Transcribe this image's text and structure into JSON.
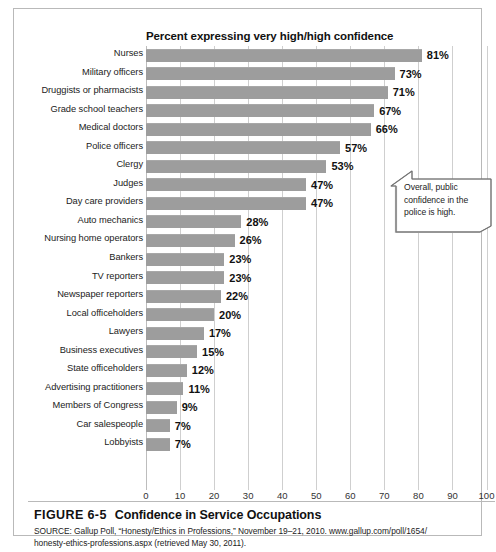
{
  "chart_data": {
    "type": "bar",
    "orientation": "horizontal",
    "title": "Percent expressing very high/high confidence",
    "xlabel": "",
    "ylabel": "",
    "xlim": [
      0,
      100
    ],
    "xticks": [
      0,
      10,
      20,
      30,
      40,
      50,
      60,
      70,
      80,
      90,
      100
    ],
    "grid": true,
    "legend": null,
    "bar_color": "#9d9d9d",
    "categories": [
      "Nurses",
      "Military officers",
      "Druggists or pharmacists",
      "Grade school teachers",
      "Medical doctors",
      "Police officers",
      "Clergy",
      "Judges",
      "Day care providers",
      "Auto mechanics",
      "Nursing home operators",
      "Bankers",
      "TV reporters",
      "Newspaper reporters",
      "Local officeholders",
      "Lawyers",
      "Business executives",
      "State officeholders",
      "Advertising practitioners",
      "Members of Congress",
      "Car salespeople",
      "Lobbyists"
    ],
    "values": [
      81,
      73,
      71,
      67,
      66,
      57,
      53,
      47,
      47,
      28,
      26,
      23,
      23,
      22,
      20,
      17,
      15,
      12,
      11,
      9,
      7,
      7
    ],
    "value_labels": [
      "81%",
      "73%",
      "71%",
      "67%",
      "66%",
      "57%",
      "53%",
      "47%",
      "47%",
      "28%",
      "26%",
      "23%",
      "23%",
      "22%",
      "20%",
      "17%",
      "15%",
      "12%",
      "11%",
      "9%",
      "7%",
      "7%"
    ],
    "annotations": [
      {
        "text": "Overall, public confidence in the police is high.",
        "points_to": "Police officers"
      }
    ]
  },
  "caption": {
    "figure_number": "FIGURE 6-5",
    "figure_title": "Confidence in Service Occupations",
    "source_line_1": "SOURCE: Gallup Poll, “Honesty/Ethics in Professions,” November 19–21, 2010. www.gallup.com/poll/1654/",
    "source_line_2": "honesty-ethics-professions.aspx (retrieved May 30, 2011)."
  }
}
